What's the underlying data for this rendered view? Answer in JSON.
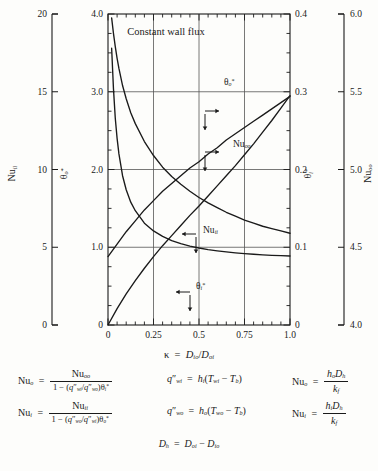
{
  "chart_data": {
    "type": "line",
    "title": "Constant wall flux",
    "xlabel": "κ = D_io/D_oi",
    "xlim": [
      0,
      1.0
    ],
    "x_ticks": [
      "0",
      "0.25",
      "0.5",
      "0.75",
      "1.0"
    ],
    "x_tick_values": [
      0,
      0.25,
      0.5,
      0.75,
      1.0
    ],
    "x_minor_per_major": 5,
    "grid": true,
    "legend": "inline-labels",
    "axes": [
      {
        "name": "Nu_ii",
        "label": "Nu",
        "sub": "ii",
        "position": "left-outer",
        "lim": [
          0,
          20
        ],
        "ticks": [
          "0",
          "5",
          "10",
          "15",
          "20"
        ],
        "tick_values": [
          0,
          5,
          10,
          15,
          20
        ]
      },
      {
        "name": "theta_o_star",
        "label": "θ",
        "sub": "o",
        "sup": "*",
        "position": "left-inner",
        "lim": [
          0,
          4.0
        ],
        "ticks": [
          "0",
          "1.0",
          "2.0",
          "3.0",
          "4.0"
        ],
        "tick_values": [
          0,
          1,
          2,
          3,
          4
        ],
        "minor_per_major": 4
      },
      {
        "name": "theta_i_star",
        "label": "θ",
        "sub": "i",
        "sup": "*",
        "position": "right-inner",
        "lim": [
          0,
          0.4
        ],
        "ticks": [
          "0",
          "0.1",
          "0.2",
          "0.3",
          "0.4"
        ],
        "tick_values": [
          0,
          0.1,
          0.2,
          0.3,
          0.4
        ],
        "minor_per_major": 4
      },
      {
        "name": "Nu_oo",
        "label": "Nu",
        "sub": "oo",
        "position": "right-outer",
        "lim": [
          4.0,
          6.0
        ],
        "ticks": [
          "4.0",
          "4.5",
          "5.0",
          "5.5",
          "6.0"
        ],
        "tick_values": [
          4.0,
          4.5,
          5.0,
          5.5,
          6.0
        ]
      }
    ],
    "series": [
      {
        "name": "Nu_ii",
        "label": "Nu",
        "sub": "ii",
        "axis": "Nu_ii",
        "arrow": "left-down",
        "x": [
          0.02,
          0.03,
          0.04,
          0.05,
          0.06,
          0.08,
          0.1,
          0.125,
          0.15,
          0.2,
          0.25,
          0.3,
          0.35,
          0.4,
          0.45,
          0.5,
          0.55,
          0.6,
          0.65,
          0.7,
          0.75,
          0.8,
          0.85,
          0.9,
          0.95,
          1.0
        ],
        "y": [
          17.8,
          15.2,
          13.3,
          12.0,
          11.0,
          9.6,
          8.7,
          7.9,
          7.35,
          6.55,
          6.05,
          5.7,
          5.43,
          5.23,
          5.07,
          4.95,
          4.85,
          4.77,
          4.7,
          4.64,
          4.59,
          4.55,
          4.51,
          4.48,
          4.46,
          4.44
        ]
      },
      {
        "name": "Nu_oo",
        "label": "Nu",
        "sub": "oo",
        "axis": "Nu_oo",
        "arrow": "left-down",
        "x": [
          0.0,
          0.05,
          0.1,
          0.15,
          0.2,
          0.25,
          0.3,
          0.35,
          0.4,
          0.45,
          0.5,
          0.55,
          0.6,
          0.65,
          0.7,
          0.75,
          0.8,
          0.85,
          0.9,
          0.95,
          1.0
        ],
        "y": [
          4.44,
          4.52,
          4.6,
          4.67,
          4.74,
          4.8,
          4.86,
          4.91,
          4.96,
          5.01,
          5.05,
          5.1,
          5.14,
          5.19,
          5.23,
          5.27,
          5.31,
          5.35,
          5.39,
          5.43,
          5.47
        ]
      },
      {
        "name": "theta_o_star",
        "label": "θ",
        "sub": "o",
        "sup": "*",
        "axis": "theta_o_star",
        "arrow": "right-down",
        "x": [
          0.0,
          0.05,
          0.1,
          0.15,
          0.2,
          0.25,
          0.3,
          0.35,
          0.4,
          0.45,
          0.5,
          0.55,
          0.6,
          0.65,
          0.7,
          0.75,
          0.8,
          0.85,
          0.9,
          0.95,
          1.0
        ],
        "y": [
          0.0,
          0.21,
          0.4,
          0.57,
          0.73,
          0.88,
          1.02,
          1.15,
          1.28,
          1.41,
          1.53,
          1.66,
          1.79,
          1.92,
          2.05,
          2.19,
          2.33,
          2.48,
          2.63,
          2.79,
          2.95
        ]
      },
      {
        "name": "theta_i_star",
        "label": "θ",
        "sub": "i",
        "sup": "*",
        "axis": "theta_i_star",
        "arrow": "left-down",
        "x": [
          0.02,
          0.03,
          0.04,
          0.05,
          0.06,
          0.08,
          0.1,
          0.125,
          0.15,
          0.2,
          0.25,
          0.3,
          0.35,
          0.4,
          0.45,
          0.5,
          0.55,
          0.6,
          0.65,
          0.7,
          0.75,
          0.8,
          0.85,
          0.9,
          0.95,
          1.0
        ],
        "y": [
          0.395,
          0.375,
          0.358,
          0.343,
          0.33,
          0.308,
          0.291,
          0.273,
          0.259,
          0.236,
          0.218,
          0.203,
          0.191,
          0.181,
          0.172,
          0.164,
          0.157,
          0.151,
          0.145,
          0.14,
          0.135,
          0.131,
          0.127,
          0.124,
          0.121,
          0.118
        ]
      }
    ]
  },
  "plot": {
    "title": "Constant wall flux",
    "x_axis_caption": {
      "kappa": "κ",
      "equals": "=",
      "num_base": "D",
      "num_sub": "io",
      "slash": "/",
      "den_base": "D",
      "den_sub": "oi"
    },
    "curve_labels": {
      "nu_oo": {
        "base": "Nu",
        "sub": "oo"
      },
      "nu_ii": {
        "base": "Nu",
        "sub": "ii"
      },
      "theta_o": {
        "base": "θ",
        "sub": "o",
        "sup": "*"
      },
      "theta_i": {
        "base": "θ",
        "sub": "i",
        "sup": "*"
      }
    },
    "axis_names": {
      "left_outer": {
        "base": "Nu",
        "sub": "ii"
      },
      "left_inner": {
        "base": "θ",
        "sub": "o",
        "sup": "*"
      },
      "right_inner": {
        "base": "θ",
        "sub": "i",
        "sup": "*"
      },
      "right_outer": {
        "base": "Nu",
        "sub": "oo"
      }
    },
    "tick_labels": {
      "left_outer": [
        "20",
        "15",
        "10",
        "5",
        "0"
      ],
      "left_inner": [
        "4.0",
        "3.0",
        "2.0",
        "1.0",
        "0"
      ],
      "right_inner": [
        "0.4",
        "0.3",
        "0.2",
        "0.1",
        "0"
      ],
      "right_outer": [
        "6.0",
        "5.5",
        "5.0",
        "4.5",
        "4.0"
      ],
      "bottom": [
        "0",
        "0.25",
        "0.5",
        "0.75",
        "1.0"
      ]
    }
  },
  "equations": {
    "eq1": {
      "lhs_base": "Nu",
      "lhs_sub": "o",
      "eq": "=",
      "num_base": "Nu",
      "num_sub": "oo",
      "den": "1 − (q″ /q″ )θ",
      "den_parts": {
        "one": "1",
        "minus": "−",
        "open": "(",
        "q1_base": "q",
        "q1_prime": "″",
        "q1_sub": "wi",
        "slash": "/",
        "q2_base": "q",
        "q2_prime": "″",
        "q2_sub": "wo",
        "close": ")",
        "theta_base": "θ",
        "theta_sub": "i",
        "theta_sup": "*"
      }
    },
    "eq2": {
      "lhs_base": "Nu",
      "lhs_sub": "i",
      "eq": "=",
      "num_base": "Nu",
      "num_sub": "ii",
      "den_parts": {
        "one": "1",
        "minus": "−",
        "open": "(",
        "q1_base": "q",
        "q1_prime": "″",
        "q1_sub": "wo",
        "slash": "/",
        "q2_base": "q",
        "q2_prime": "″",
        "q2_sub": "wi",
        "close": ")",
        "theta_base": "θ",
        "theta_sub": "o",
        "theta_sup": "*"
      }
    },
    "eq3": {
      "lhs_base": "q",
      "lhs_prime": "″",
      "lhs_sub": "wi",
      "eq": "=",
      "h_base": "h",
      "h_sub": "i",
      "open": "(",
      "t1_base": "T",
      "t1_sub": "wi",
      "minus": "−",
      "t2_base": "T",
      "t2_sub": "b",
      "close": ")"
    },
    "eq4": {
      "lhs_base": "q",
      "lhs_prime": "″",
      "lhs_sub": "wo",
      "eq": "=",
      "h_base": "h",
      "h_sub": "o",
      "open": "(",
      "t1_base": "T",
      "t1_sub": "wo",
      "minus": "−",
      "t2_base": "T",
      "t2_sub": "b",
      "close": ")"
    },
    "eq5": {
      "lhs_base": "Nu",
      "lhs_sub": "o",
      "eq": "=",
      "num_h": "h",
      "num_h_sub": "o",
      "num_d": "D",
      "num_d_sub": "h",
      "den_k": "k",
      "den_k_sub": "f"
    },
    "eq6": {
      "lhs_base": "Nu",
      "lhs_sub": "i",
      "eq": "=",
      "num_h": "h",
      "num_h_sub": "i",
      "num_d": "D",
      "num_d_sub": "h",
      "den_k": "k",
      "den_k_sub": "f"
    },
    "eq7": {
      "lhs_base": "D",
      "lhs_sub": "h",
      "eq": "=",
      "t1_base": "D",
      "t1_sub": "oi",
      "minus": "−",
      "t2_base": "D",
      "t2_sub": "io"
    }
  },
  "colors": {
    "ink": "#1a1a1a",
    "grid": "#555555",
    "background": "#fdfdfb"
  }
}
